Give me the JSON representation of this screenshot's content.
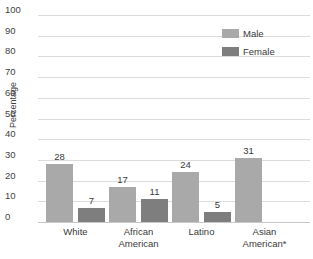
{
  "title_sliver": "— —— — ———",
  "legend": {
    "items": [
      {
        "label": "Male",
        "color": "#a9a9a9"
      },
      {
        "label": "Female",
        "color": "#7e7e7e"
      }
    ]
  },
  "chart_data": {
    "type": "bar",
    "title": "",
    "xlabel": "",
    "ylabel": "Percentage",
    "ylim": [
      0,
      100
    ],
    "yticks": [
      100,
      90,
      80,
      70,
      60,
      50,
      40,
      30,
      20,
      10,
      0
    ],
    "grid": true,
    "legend_position": "top-right",
    "categories": [
      "White",
      "African\nAmerican",
      "Latino",
      "Asian\nAmerican*"
    ],
    "series": [
      {
        "name": "Male",
        "color": "#a9a9a9",
        "values": [
          28,
          17,
          24,
          31
        ]
      },
      {
        "name": "Female",
        "color": "#7e7e7e",
        "values": [
          7,
          11,
          5,
          null
        ]
      }
    ],
    "data_labels": [
      "28",
      "7",
      "17",
      "11",
      "24",
      "5",
      "31"
    ],
    "note": "Female bar for Asian American* is not visible (chart cropped at right edge)"
  }
}
